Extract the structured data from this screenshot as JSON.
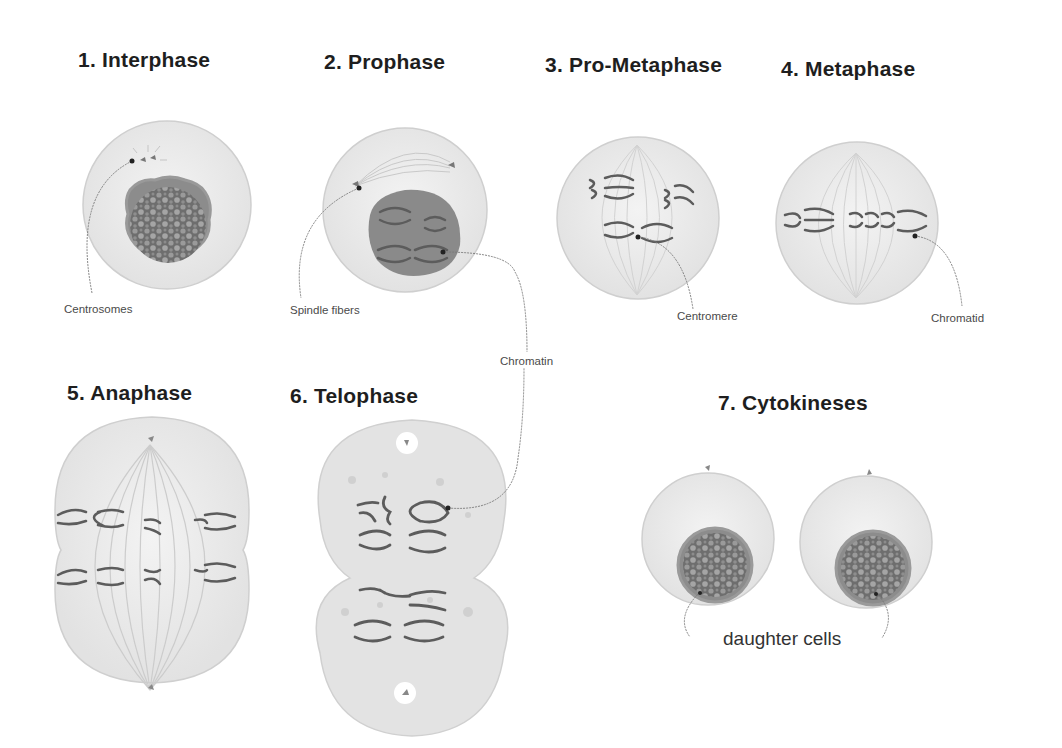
{
  "diagram": {
    "colors": {
      "cell_fill": "#ececec",
      "cell_stroke": "#c8c8c8",
      "nucleus_fill": "#8a8a8a",
      "chromosome": "#5a5a5a",
      "leader_line": "#777777",
      "title_text": "#1e1e1e",
      "label_text": "#4a4a4a"
    },
    "stages": [
      {
        "number": 1,
        "title": "1. Interphase"
      },
      {
        "number": 2,
        "title": "2. Prophase"
      },
      {
        "number": 3,
        "title": "3. Pro-Metaphase"
      },
      {
        "number": 4,
        "title": "4. Metaphase"
      },
      {
        "number": 5,
        "title": "5. Anaphase"
      },
      {
        "number": 6,
        "title": "6. Telophase"
      },
      {
        "number": 7,
        "title": "7. Cytokineses"
      }
    ],
    "annotations": {
      "centrosomes": "Centrosomes",
      "spindle_fibers": "Spindle fibers",
      "centromere": "Centromere",
      "chromatid": "Chromatid",
      "chromatin": "Chromatin",
      "daughter_cells": "daughter cells"
    }
  }
}
